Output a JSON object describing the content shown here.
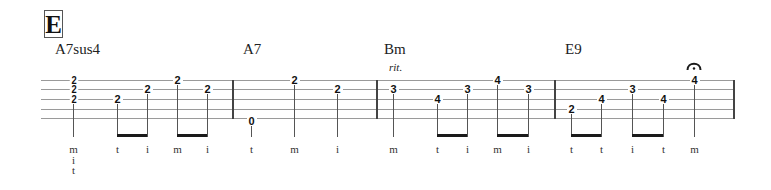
{
  "section": {
    "label": "E"
  },
  "tab": {
    "instrument_strings": 5,
    "string_y": [
      80,
      89,
      99,
      109,
      119
    ],
    "staff": {
      "x_start": 41,
      "x_end": 734
    },
    "barlines_x": [
      233,
      377,
      555,
      733
    ]
  },
  "measures": [
    {
      "chord": "A7sus4",
      "chord_x": 55,
      "expression": null,
      "notes": [
        {
          "x": 73,
          "frets": [
            {
              "string": 1,
              "fret": "2"
            },
            {
              "string": 2,
              "fret": "2"
            },
            {
              "string": 3,
              "fret": "2"
            }
          ],
          "fingering": [
            "m",
            "i",
            "t"
          ]
        },
        {
          "x": 117,
          "frets": [
            {
              "string": 3,
              "fret": "2"
            }
          ],
          "fingering": [
            "t"
          ],
          "beam_to_next": true
        },
        {
          "x": 147,
          "frets": [
            {
              "string": 2,
              "fret": "2"
            }
          ],
          "fingering": [
            "i"
          ]
        },
        {
          "x": 177,
          "frets": [
            {
              "string": 1,
              "fret": "2"
            }
          ],
          "fingering": [
            "m"
          ],
          "beam_to_next": true
        },
        {
          "x": 207,
          "frets": [
            {
              "string": 2,
              "fret": "2"
            }
          ],
          "fingering": [
            "i"
          ]
        }
      ]
    },
    {
      "chord": "A7",
      "chord_x": 243,
      "expression": null,
      "notes": [
        {
          "x": 251,
          "frets": [
            {
              "string": 5,
              "fret": "0"
            }
          ],
          "fingering": [
            "t"
          ]
        },
        {
          "x": 294,
          "frets": [
            {
              "string": 1,
              "fret": "2"
            }
          ],
          "fingering": [
            "m"
          ]
        },
        {
          "x": 337,
          "frets": [
            {
              "string": 2,
              "fret": "2"
            }
          ],
          "fingering": [
            "i"
          ]
        }
      ]
    },
    {
      "chord": "Bm",
      "chord_x": 384,
      "expression": "rit.",
      "expression_x": 389,
      "notes": [
        {
          "x": 393,
          "frets": [
            {
              "string": 2,
              "fret": "3"
            }
          ],
          "fingering": [
            "m"
          ]
        },
        {
          "x": 437,
          "frets": [
            {
              "string": 3,
              "fret": "4"
            }
          ],
          "fingering": [
            "t"
          ],
          "beam_to_next": true
        },
        {
          "x": 467,
          "frets": [
            {
              "string": 2,
              "fret": "3"
            }
          ],
          "fingering": [
            "i"
          ]
        },
        {
          "x": 497,
          "frets": [
            {
              "string": 1,
              "fret": "4"
            }
          ],
          "fingering": [
            "m"
          ],
          "beam_to_next": true
        },
        {
          "x": 528,
          "frets": [
            {
              "string": 2,
              "fret": "3"
            }
          ],
          "fingering": [
            "i"
          ]
        }
      ]
    },
    {
      "chord": "E9",
      "chord_x": 565,
      "expression": null,
      "notes": [
        {
          "x": 571,
          "frets": [
            {
              "string": 4,
              "fret": "2"
            }
          ],
          "fingering": [
            "t"
          ],
          "beam_to_next": true
        },
        {
          "x": 601,
          "frets": [
            {
              "string": 3,
              "fret": "4"
            }
          ],
          "fingering": [
            "t"
          ]
        },
        {
          "x": 632,
          "frets": [
            {
              "string": 2,
              "fret": "3"
            }
          ],
          "fingering": [
            "i"
          ],
          "beam_to_next": true
        },
        {
          "x": 663,
          "frets": [
            {
              "string": 3,
              "fret": "4"
            }
          ],
          "fingering": [
            "t"
          ]
        },
        {
          "x": 694,
          "frets": [
            {
              "string": 1,
              "fret": "4"
            }
          ],
          "fingering": [
            "m"
          ],
          "fermata": true
        }
      ]
    }
  ],
  "colors": {
    "ink": "#1a1a1a",
    "staff_line": "#9a9a9a"
  }
}
